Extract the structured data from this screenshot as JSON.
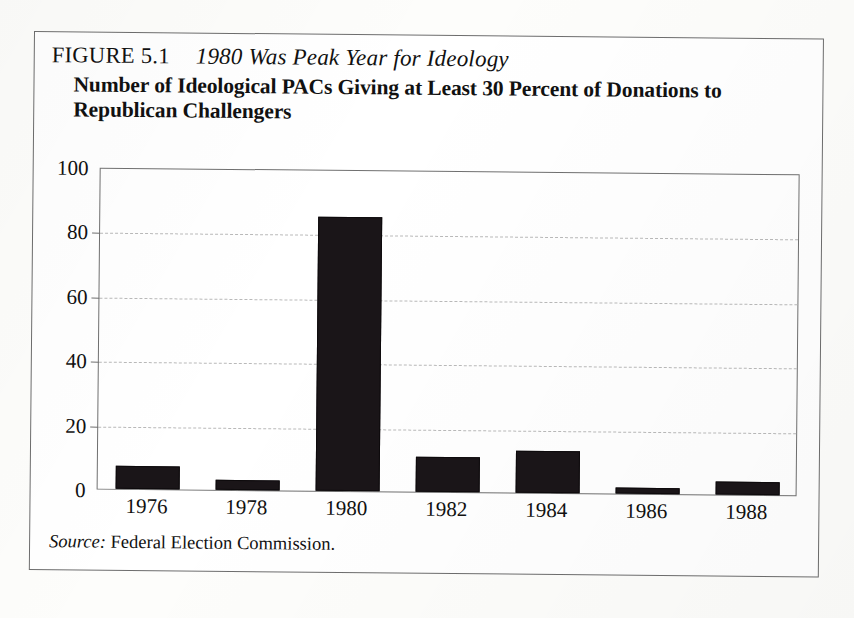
{
  "figure": {
    "number_label": "FIGURE 5.1",
    "caption": "1980 Was Peak Year for Ideology",
    "subtitle": "Number of Ideological PACs Giving at Least 30 Percent of Donations to Republican Challengers",
    "source_word": "Source:",
    "source_text": "Federal Election Commission."
  },
  "chart_data": {
    "type": "bar",
    "title": "Number of Ideological PACs Giving at Least 30 Percent of Donations to Republican Challengers",
    "subtitle": "1980 Was Peak Year for Ideology",
    "categories": [
      "1976",
      "1978",
      "1980",
      "1982",
      "1984",
      "1986",
      "1988"
    ],
    "values": [
      7,
      3,
      85,
      11,
      13,
      2,
      4
    ],
    "xlabel": "",
    "ylabel": "",
    "ylim": [
      0,
      100
    ],
    "yticks": [
      0,
      20,
      40,
      60,
      80,
      100
    ],
    "ytick_labels": [
      "0",
      "20",
      "40",
      "60",
      "80",
      "100"
    ],
    "grid": true,
    "grid_style": "dashed-horizontal",
    "legend": false,
    "bar_color": "#1a1518",
    "source": "Source: Federal Election Commission."
  },
  "colors": {
    "bar": "#1a1518",
    "frame": "#707070",
    "grid": "#b9b9b9",
    "page_background": "#fdfdfb",
    "figure_background": "#ffffff",
    "text": "#111111"
  }
}
